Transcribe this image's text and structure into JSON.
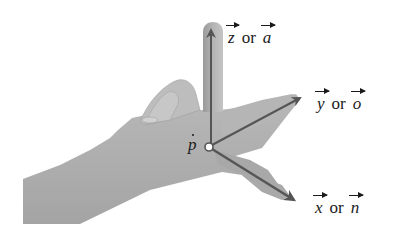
{
  "figure": {
    "origin_label": "p",
    "origin_label_decoration": "dot-above",
    "axes": [
      {
        "id": "z",
        "primary": "z",
        "connector": "or",
        "alternate": "a",
        "finger": "index"
      },
      {
        "id": "y",
        "primary": "y",
        "connector": "or",
        "alternate": "o",
        "finger": "thumb"
      },
      {
        "id": "x",
        "primary": "x",
        "connector": "or",
        "alternate": "n",
        "finger": "middle"
      }
    ]
  },
  "colors": {
    "background": "#ffffff",
    "skin_light": "#c9c9c9",
    "skin_mid": "#a9a9a9",
    "skin_dark": "#8a8a8a",
    "arrow": "#555555",
    "text": "#1a1a1a"
  }
}
